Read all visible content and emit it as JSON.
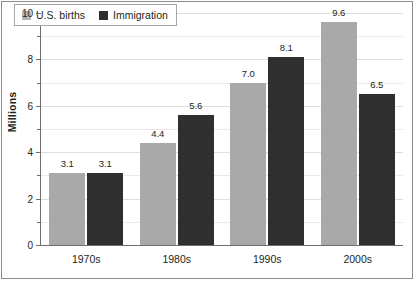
{
  "chart_data": {
    "type": "bar",
    "title": "",
    "subtitle": "",
    "xlabel": "",
    "ylabel": "Millions",
    "categories": [
      "1970s",
      "1980s",
      "1990s",
      "2000s"
    ],
    "series": [
      {
        "name": "U.S. births",
        "color": "#a9a9a9",
        "values": [
          3.1,
          4.4,
          7.0,
          9.6
        ],
        "labels": [
          "3.1",
          "4.4",
          "7.0",
          "9.6"
        ]
      },
      {
        "name": "Immigration",
        "color": "#2f2f2f",
        "values": [
          3.1,
          5.6,
          8.1,
          6.5
        ],
        "labels": [
          "3.1",
          "5.6",
          "8.1",
          "6.5"
        ]
      }
    ],
    "ylim": [
      0,
      10
    ],
    "yticks": [
      0,
      2,
      4,
      6,
      8,
      10
    ],
    "ytick_labels": [
      "0",
      "2",
      "4",
      "6",
      "8",
      "10"
    ],
    "yminor_ticks": [
      1,
      3,
      5,
      7,
      9
    ],
    "grid": true,
    "grid_axis": "y",
    "legend_position": "upper left"
  },
  "legend": {
    "items": [
      {
        "label": "U.S. births",
        "swatch": "legend-swatch-births"
      },
      {
        "label": "Immigration",
        "swatch": "legend-swatch-immigration"
      }
    ]
  }
}
